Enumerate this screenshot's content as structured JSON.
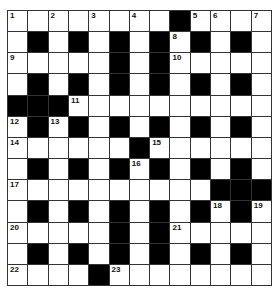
{
  "puzzle": {
    "rows": 13,
    "cols": 13,
    "colors": {
      "block": "#000000",
      "empty": "#ffffff",
      "line": "#333333"
    },
    "layout": [
      "WWWWWWWWBWWWW",
      "WBWBWBWBWBWBW",
      "WWWWWBWBWWWWW",
      "WBWBWBWBWBWBW",
      "BBBWWWWWWWWWW",
      "WBWBWBWBWBWBW",
      "WWWWWWBWWWWWW",
      "WBWBWBWBWBWBW",
      "WWWWWWWWWWBBB",
      "WBWBWBWBWBWBW",
      "WWWWWBWBWWWWW",
      "WBWBWBWBWBWBW",
      "WWWWBWWWWWWWW"
    ],
    "numbers": [
      {
        "r": 0,
        "c": 0,
        "n": "1"
      },
      {
        "r": 0,
        "c": 2,
        "n": "2"
      },
      {
        "r": 0,
        "c": 4,
        "n": "3"
      },
      {
        "r": 0,
        "c": 6,
        "n": "4"
      },
      {
        "r": 0,
        "c": 9,
        "n": "5"
      },
      {
        "r": 0,
        "c": 10,
        "n": "6"
      },
      {
        "r": 0,
        "c": 12,
        "n": "7"
      },
      {
        "r": 1,
        "c": 8,
        "n": "8"
      },
      {
        "r": 2,
        "c": 0,
        "n": "9"
      },
      {
        "r": 2,
        "c": 8,
        "n": "10"
      },
      {
        "r": 4,
        "c": 3,
        "n": "11"
      },
      {
        "r": 5,
        "c": 0,
        "n": "12"
      },
      {
        "r": 5,
        "c": 2,
        "n": "13"
      },
      {
        "r": 6,
        "c": 0,
        "n": "14"
      },
      {
        "r": 6,
        "c": 7,
        "n": "15"
      },
      {
        "r": 7,
        "c": 6,
        "n": "16"
      },
      {
        "r": 8,
        "c": 0,
        "n": "17"
      },
      {
        "r": 9,
        "c": 10,
        "n": "18"
      },
      {
        "r": 9,
        "c": 12,
        "n": "19"
      },
      {
        "r": 10,
        "c": 0,
        "n": "20"
      },
      {
        "r": 10,
        "c": 8,
        "n": "21"
      },
      {
        "r": 12,
        "c": 0,
        "n": "22"
      },
      {
        "r": 12,
        "c": 5,
        "n": "23"
      }
    ]
  }
}
